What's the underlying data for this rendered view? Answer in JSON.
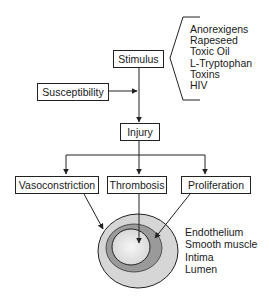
{
  "diagram": {
    "nodes": {
      "stimulus": "Stimulus",
      "susceptibility": "Susceptibility",
      "injury": "Injury",
      "vasoconstriction": "Vasoconstriction",
      "thrombosis": "Thrombosis",
      "proliferation": "Proliferation"
    },
    "stimulus_examples": [
      "Anorexigens",
      "Rapeseed",
      "Toxic Oil",
      "L-Tryptophan",
      "Toxins",
      "HIV"
    ],
    "vessel_layers": [
      "Endothelium",
      "Smooth muscle",
      "Intima",
      "Lumen"
    ],
    "colors": {
      "outer_layer": "#d6d6d6",
      "middle_layer": "#9a9a9a",
      "lumen": "#e4e4e4",
      "line": "#222222"
    },
    "edges": [
      [
        "stimulus",
        "injury"
      ],
      [
        "susceptibility",
        "stimulus-injury-path"
      ],
      [
        "injury",
        "vasoconstriction"
      ],
      [
        "injury",
        "thrombosis"
      ],
      [
        "injury",
        "proliferation"
      ],
      [
        "vasoconstriction",
        "vessel"
      ],
      [
        "thrombosis",
        "vessel"
      ],
      [
        "proliferation",
        "vessel"
      ]
    ]
  }
}
